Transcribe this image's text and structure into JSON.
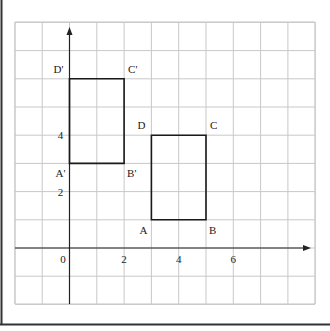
{
  "figure": {
    "grid": {
      "x_range": [
        -2,
        9
      ],
      "y_range": [
        -2,
        8
      ],
      "step": 1
    },
    "axes": {
      "x_ticks": [
        {
          "value": 0,
          "label": "0"
        },
        {
          "value": 2,
          "label": "2"
        },
        {
          "value": 4,
          "label": "4"
        },
        {
          "value": 6,
          "label": "6"
        }
      ],
      "y_ticks": [
        {
          "value": 2,
          "label": "2"
        },
        {
          "value": 4,
          "label": "4"
        }
      ]
    },
    "shapes": [
      {
        "name": "rectangle-abcd",
        "vertices": [
          {
            "label": "A",
            "x": 3,
            "y": 1,
            "anchor": "bottom-left"
          },
          {
            "label": "B",
            "x": 5,
            "y": 1,
            "anchor": "bottom-right"
          },
          {
            "label": "C",
            "x": 5,
            "y": 4,
            "anchor": "top-right"
          },
          {
            "label": "D",
            "x": 3,
            "y": 4,
            "anchor": "top-left"
          }
        ]
      },
      {
        "name": "rectangle-a-prime-b-prime-c-prime-d-prime",
        "vertices": [
          {
            "label": "A'",
            "x": 0,
            "y": 3,
            "anchor": "bottom-left"
          },
          {
            "label": "B'",
            "x": 2,
            "y": 3,
            "anchor": "bottom-right"
          },
          {
            "label": "C'",
            "x": 2,
            "y": 6,
            "anchor": "top-right"
          },
          {
            "label": "D'",
            "x": 0,
            "y": 6,
            "anchor": "top-left"
          }
        ]
      }
    ],
    "colors": {
      "grid": "#c8c8c8",
      "axis": "#222222",
      "shape": "#1a1a1a",
      "frame": "#333333"
    }
  }
}
